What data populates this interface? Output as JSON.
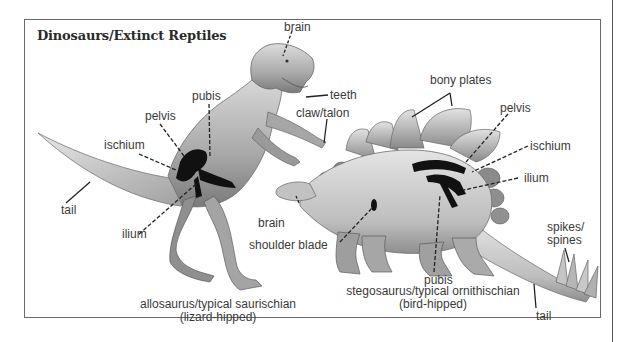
{
  "title": "Dinosaurs/Extinct Reptiles",
  "allosaurus": {
    "labels": {
      "brain": "brain",
      "teeth": "teeth",
      "pubis": "pubis",
      "pelvis": "pelvis",
      "ischium": "ischium",
      "claw": "claw/talon",
      "tail": "tail",
      "ilium": "ilium"
    },
    "caption_line1": "allosaurus/typical saurischian",
    "caption_line2": "(lizard-hipped)"
  },
  "stegosaurus": {
    "labels": {
      "bony_plates": "bony plates",
      "pelvis": "pelvis",
      "ischium": "ischium",
      "ilium": "ilium",
      "brain": "brain",
      "shoulder_blade": "shoulder blade",
      "spikes_line1": "spikes/",
      "spikes_line2": "spines",
      "pubis": "pubis",
      "tail": "tail"
    },
    "caption_line1": "stegosaurus/typical ornithischian",
    "caption_line2": "(bird-hipped)"
  },
  "colors": {
    "border": "#6a6a6a",
    "text": "#3a3a3a",
    "bone": "#111111",
    "skin_light": "#d8d8d8",
    "skin_mid": "#a8a8a8",
    "skin_dark": "#6e6e6e"
  }
}
